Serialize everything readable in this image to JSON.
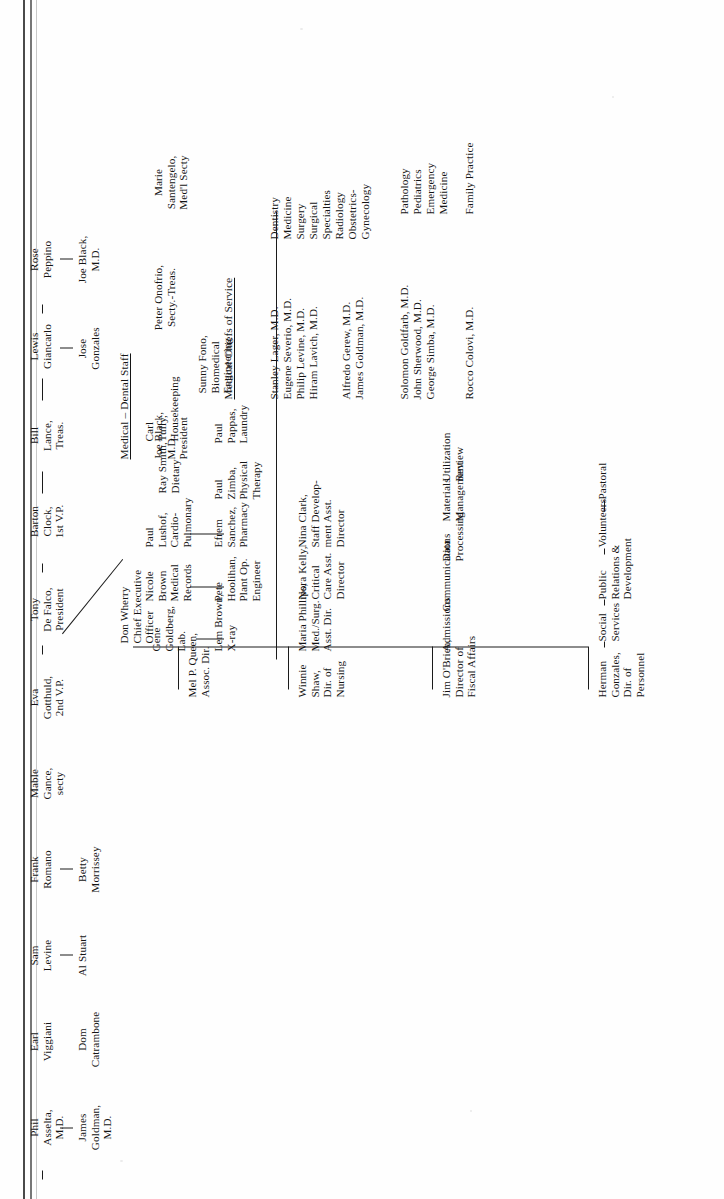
{
  "document": {
    "kind": "organizational-chart",
    "orientation": "rotated-90-ccw",
    "page_background": "#ffffff",
    "ink_color": "#141414"
  },
  "board": {
    "row1": [
      {
        "id": "asselta",
        "text": "Phil\nAsselta,\nM.D."
      },
      {
        "id": "viggiani",
        "text": "Earl\nViggiani"
      },
      {
        "id": "levine",
        "text": "Sam\nLevine"
      },
      {
        "id": "romano",
        "text": "Frank\nRomano"
      },
      {
        "id": "gance",
        "text": "Mable\nGance,\nsecty"
      },
      {
        "id": "gotthuld",
        "text": "Eva\nGotthuld,\n2nd V.P."
      },
      {
        "id": "defalco",
        "text": "Tony\nDe Falco,\nPresident"
      },
      {
        "id": "clock",
        "text": "Barton\nClock,\n1st V.P."
      },
      {
        "id": "lance",
        "text": "Bill\nLance,\nTreas."
      },
      {
        "id": "giancarlo",
        "text": "Lewis\nGiancarlo"
      },
      {
        "id": "peppino",
        "text": "Rose\nPeppino"
      }
    ],
    "row2": [
      {
        "id": "goldman",
        "text": "James\nGoldman,\nM.D."
      },
      {
        "id": "catrambone",
        "text": "Dom\nCatrambone"
      },
      {
        "id": "stuart",
        "text": "Al Stuart"
      },
      {
        "id": "morrissey",
        "text": "Betty\nMorrissey"
      },
      {
        "id": "gonzales-jose",
        "text": "Jose\nGonzales"
      },
      {
        "id": "black-joe",
        "text": "Joe Black,\nM.D."
      }
    ]
  },
  "executive": {
    "ceo": "Don Wherry\nChief Executive\nOfficer"
  },
  "medical_dental_staff": {
    "heading": "Medical  –  Dental Staff",
    "officers": [
      {
        "id": "president",
        "text": "Joe Black,\nM.D.\nPresident"
      },
      {
        "id": "secty-treas",
        "text": "Peter Onofrio,\nSecty.-Treas."
      },
      {
        "id": "med-secty",
        "text": "Marie\nSantengelo,\nMed'l Secty"
      }
    ]
  },
  "medical_chiefs": {
    "heading": "Medical Chiefs of Service",
    "group1": [
      {
        "name": "Stanley Lager, M.D.",
        "service": "Dentistry"
      },
      {
        "name": "Eugene Severio, M.D.",
        "service": "Medicine"
      },
      {
        "name": "Philip Levine, M.D.",
        "service": "Surgery"
      },
      {
        "name": "Hiram Lavich, M.D.",
        "service": "Surgical\nSpecialties"
      }
    ],
    "group2": [
      {
        "name": "Alfredo Gerew, M.D.",
        "service": "Radiology"
      },
      {
        "name": "James Goldman, M.D.",
        "service": "Obstetrics-\nGynecology"
      }
    ],
    "group3": [
      {
        "name": "Solomon Goldfarb, M.D.",
        "service": "Pathology"
      },
      {
        "name": "John Sherwood, M.D.",
        "service": "Pediatrics"
      },
      {
        "name": "George Simba, M.D.",
        "service": "Emergency\nMedicine"
      }
    ],
    "group4": [
      {
        "name": "Rocco Colovi, M.D.",
        "service": "Family Practice"
      }
    ]
  },
  "directors": [
    {
      "id": "personnel",
      "text": "Herman\nGonzales,\nDir. of\nPersonnel"
    },
    {
      "id": "fiscal",
      "text": "Jim O'Brien,\nDirector of\nFiscal Affairs"
    },
    {
      "id": "nursing",
      "text": "Winnie\nShaw,\nDir. of\nNursing"
    },
    {
      "id": "assoc-dir",
      "text": "Mel P. Queen,\nAssoc. Dir."
    }
  ],
  "personnel_departments": [
    {
      "id": "social-services",
      "text": "Social\nServices"
    },
    {
      "id": "public-relations",
      "text": "Public\nRelations &\nDevelopment"
    },
    {
      "id": "volunteers",
      "text": "Volunteers"
    },
    {
      "id": "pastoral",
      "text": "Pastoral"
    }
  ],
  "fiscal_departments": [
    {
      "id": "admissions",
      "text": "Admissions"
    },
    {
      "id": "communications",
      "text": "Communications"
    },
    {
      "id": "data-processing",
      "text": "Data\nProcessing"
    },
    {
      "id": "materials-management",
      "text": "Materials\nManagement"
    },
    {
      "id": "utilization-review",
      "text": "Utilization\nReview"
    }
  ],
  "nursing_staff": [
    {
      "id": "med-surg",
      "text": "Maria Phillips,\nMed./Surg.\nAsst. Dir."
    },
    {
      "id": "critical-care",
      "text": "Nora Kelly,\nCritical\nCare Asst.\nDirector"
    },
    {
      "id": "staff-dev",
      "text": "Nina Clark,\nStaff Develop-\nment Asst.\nDirector"
    }
  ],
  "ancillary_left": [
    {
      "id": "xray",
      "text": "Lem Brown,\nX-ray"
    },
    {
      "id": "plant-ops",
      "text": "Pete\nHoolihan,\nPlant Op.\nEngineer"
    },
    {
      "id": "pharmacy",
      "text": "Efrem\nSanchez,\nPharmacy"
    },
    {
      "id": "physical-therapy",
      "text": "Paul\nZimba,\nPhysical\nTherapy"
    },
    {
      "id": "laundry",
      "text": "Paul\nPappas,\nLaundry"
    }
  ],
  "ancillary_right": [
    {
      "id": "lab",
      "text": "Gene\nGoldberg,\nLab."
    },
    {
      "id": "medical-records",
      "text": "Nicole\nBrown\nMedical\nRecords"
    },
    {
      "id": "cardio-pulmonary",
      "text": "Paul\nLushof,\nCardio-\nPulmonary"
    },
    {
      "id": "dietary",
      "text": "Ray Smith,\nDietary"
    },
    {
      "id": "housekeeping",
      "text": "Carl\nTully,\nHousekeeping"
    }
  ],
  "biomedical": {
    "id": "biomedical-engineering",
    "text": "Sunny Fono,\nBiomedical\nEngineering"
  }
}
